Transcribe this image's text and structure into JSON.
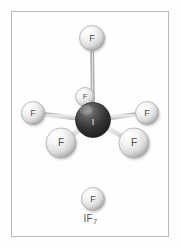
{
  "figure": {
    "caption_element": "IF",
    "caption_subscript": "7",
    "caption_full": "IF7",
    "molecule_name": "iodine heptafluoride",
    "geometry": "pentagonal bipyramidal",
    "frame_color": "#b9b9b9",
    "background_color": "#fefefe"
  },
  "palette": {
    "central_atom_dark": "#2b2b2b",
    "central_atom_mid": "#4f4f4f",
    "central_atom_highlight": "#9a9a9a",
    "fluorine_light": "#ffffff",
    "fluorine_mid": "#dcdcdc",
    "fluorine_shadow": "#9f9f9f",
    "bond_color": "#d8d8d8",
    "bond_edge": "#b0b0b0",
    "label_color": "#4a4a4a"
  },
  "atoms": [
    {
      "id": "i-center",
      "symbol": "I",
      "name": "iodine-center",
      "cx": 93,
      "cy": 120,
      "r": 17.5,
      "kind": "central",
      "label_size": "normal"
    },
    {
      "id": "f-axial-top",
      "symbol": "F",
      "name": "fluorine-axial-top",
      "cx": 92,
      "cy": 38,
      "r": 12.5,
      "kind": "ligand",
      "label_size": "normal"
    },
    {
      "id": "f-axial-bottom",
      "symbol": "F",
      "name": "fluorine-axial-bottom",
      "cx": 93,
      "cy": 199,
      "r": 11.5,
      "kind": "ligand",
      "label_size": "normal"
    },
    {
      "id": "f-eq-back",
      "symbol": "F",
      "name": "fluorine-equatorial-back",
      "cx": 85,
      "cy": 97,
      "r": 9.5,
      "kind": "ligand",
      "label_size": "small"
    },
    {
      "id": "f-eq-left",
      "symbol": "F",
      "name": "fluorine-equatorial-left",
      "cx": 33,
      "cy": 113,
      "r": 11.5,
      "kind": "ligand",
      "label_size": "normal"
    },
    {
      "id": "f-eq-right",
      "symbol": "F",
      "name": "fluorine-equatorial-right",
      "cx": 147,
      "cy": 113,
      "r": 11.5,
      "kind": "ligand",
      "label_size": "normal"
    },
    {
      "id": "f-eq-frontleft",
      "symbol": "F",
      "name": "fluorine-equatorial-front-left",
      "cx": 61,
      "cy": 143,
      "r": 15.0,
      "kind": "ligand",
      "label_size": "big"
    },
    {
      "id": "f-eq-frontright",
      "symbol": "F",
      "name": "fluorine-equatorial-front-right",
      "cx": 134,
      "cy": 143,
      "r": 15.0,
      "kind": "ligand",
      "label_size": "big"
    }
  ],
  "bonds": [
    {
      "name": "bond-iodine-axial-top",
      "x1": 93,
      "y1": 120,
      "x2": 92,
      "y2": 38,
      "width": 4.0
    },
    {
      "name": "bond-iodine-axial-bottom",
      "x1": 93,
      "y1": 120,
      "x2": 93,
      "y2": 199,
      "width": 4.0
    },
    {
      "name": "bond-iodine-equatorial-back",
      "x1": 93,
      "y1": 120,
      "x2": 85,
      "y2": 97,
      "width": 3.4
    },
    {
      "name": "bond-iodine-equatorial-left",
      "x1": 93,
      "y1": 120,
      "x2": 33,
      "y2": 113,
      "width": 4.4
    },
    {
      "name": "bond-iodine-equatorial-right",
      "x1": 93,
      "y1": 120,
      "x2": 147,
      "y2": 113,
      "width": 4.4
    },
    {
      "name": "bond-iodine-equatorial-front-left",
      "x1": 93,
      "y1": 120,
      "x2": 61,
      "y2": 143,
      "width": 4.8
    },
    {
      "name": "bond-iodine-equatorial-front-right",
      "x1": 93,
      "y1": 120,
      "x2": 134,
      "y2": 143,
      "width": 4.8
    }
  ]
}
